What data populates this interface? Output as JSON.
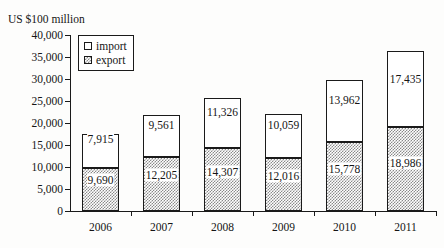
{
  "chart_data": {
    "type": "bar",
    "subtype": "stacked-column",
    "title": "",
    "unit_caption": "US $100 million",
    "xlabel": "",
    "ylabel": "",
    "ylim": [
      0,
      40000
    ],
    "ytick_step": 5000,
    "ytick_labels": [
      "0",
      "5,000",
      "10,000",
      "15,000",
      "20,000",
      "25,000",
      "30,000",
      "35,000",
      "40,000"
    ],
    "ytick_values": [
      0,
      5000,
      10000,
      15000,
      20000,
      25000,
      30000,
      35000,
      40000
    ],
    "grid": false,
    "legend_position": "top-left-inside",
    "categories": [
      "2006",
      "2007",
      "2008",
      "2009",
      "2010",
      "2011"
    ],
    "series": [
      {
        "name": "export",
        "fill": "hatched",
        "values": [
          9690,
          12205,
          14307,
          12016,
          15778,
          18986
        ],
        "labels": [
          "9,690",
          "12,205",
          "14,307",
          "12,016",
          "15,778",
          "18,986"
        ]
      },
      {
        "name": "import",
        "fill": "white",
        "values": [
          7915,
          9561,
          11326,
          10059,
          13962,
          17435
        ],
        "labels": [
          "7,915",
          "9,561",
          "11,326",
          "10,059",
          "13,962",
          "17,435"
        ]
      }
    ],
    "totals": [
      17605,
      21766,
      25633,
      22075,
      29740,
      36421
    ]
  },
  "legend": {
    "items": [
      {
        "label": "import",
        "swatch": "white-square"
      },
      {
        "label": "export",
        "swatch": "hatched-square"
      }
    ]
  },
  "colors": {
    "axis": "#1a1a1a",
    "text": "#151515",
    "import_fill": "#ffffff",
    "export_fill": "#8a8a8a",
    "background": "#fdfdfc"
  }
}
